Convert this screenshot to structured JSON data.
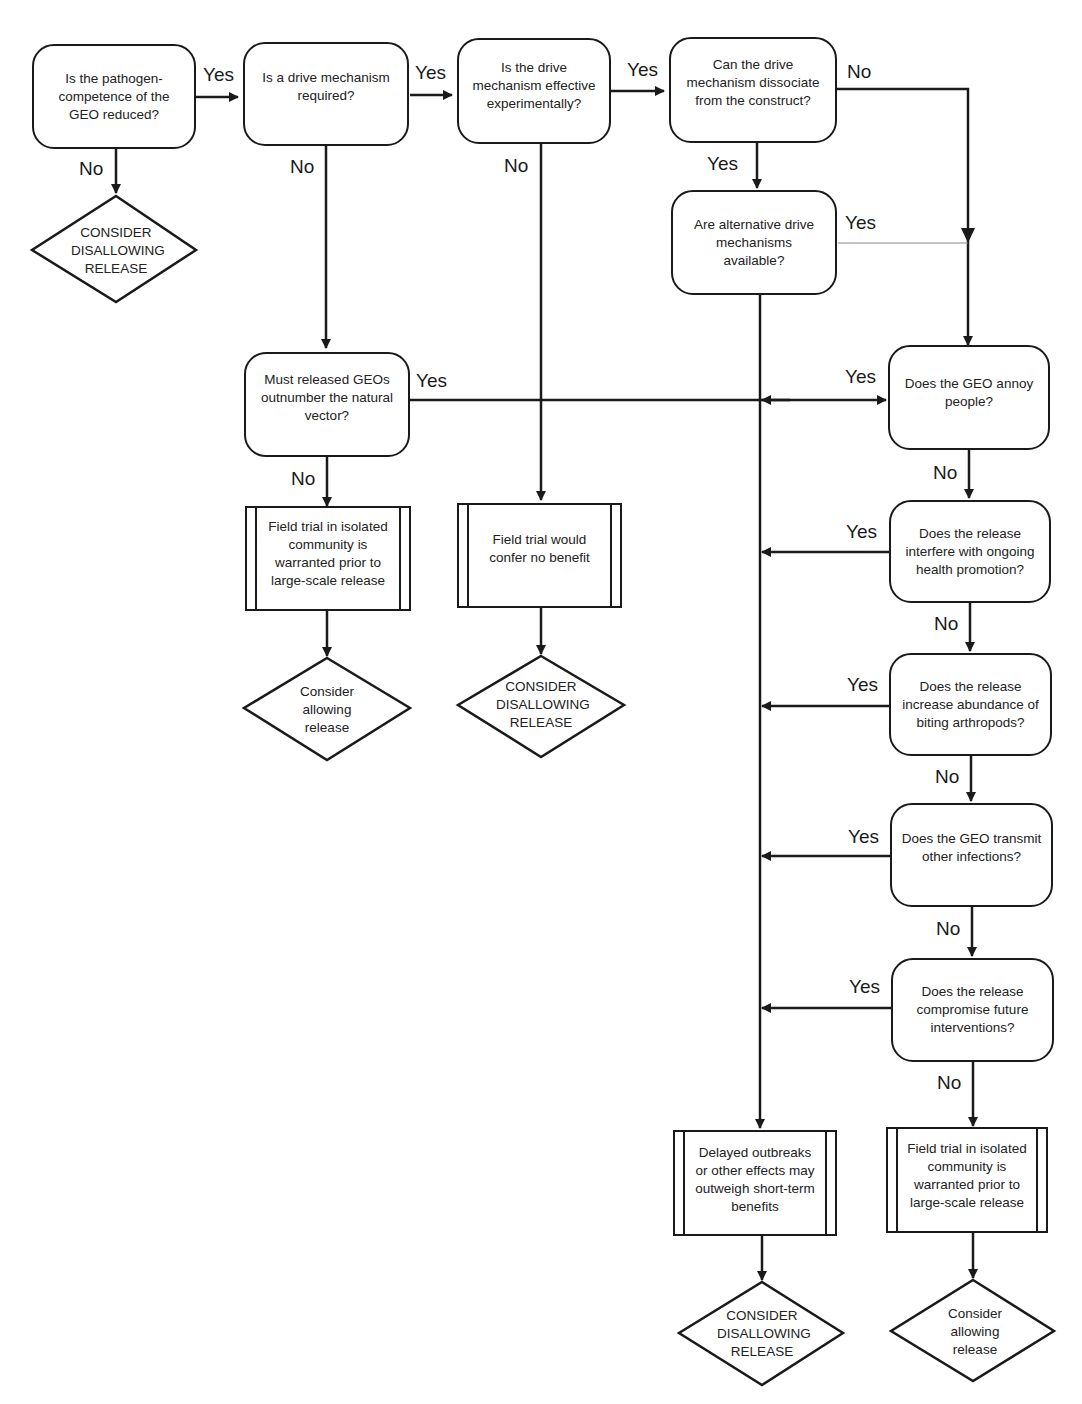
{
  "nodes": {
    "q_pathogen": "Is the pathogen-competence of the GEO reduced?",
    "q_drive_required": "Is a drive mechanism required?",
    "q_drive_effective": "Is the drive mechanism effective experimentally?",
    "q_drive_dissociate": "Can the drive mechanism dissociate from the construct?",
    "q_alternative": "Are alternative drive mechanisms available?",
    "q_outnumber": "Must released GEOs outnumber the natural vector?",
    "q_annoy": "Does the GEO annoy people?",
    "q_interfere": "Does the release interfere with ongoing health promotion?",
    "q_abundance": "Does the release increase abundance of biting arthropods?",
    "q_transmit": "Does the GEO transmit other infections?",
    "q_compromise": "Does the release compromise future interventions?",
    "p_field_trial_left": "Field trial in isolated community is warranted prior to large-scale release",
    "p_no_benefit": "Field trial would confer no benefit",
    "p_delayed": "Delayed outbreaks or other effects may outweigh short-term benefits",
    "p_field_trial_right": "Field trial in isolated community is warranted prior to large-scale release",
    "t_disallow_1": "CONSIDER DISALLOWING RELEASE",
    "t_allow_1": "Consider allowing release",
    "t_disallow_2": "CONSIDER DISALLOWING RELEASE",
    "t_disallow_3": "CONSIDER DISALLOWING RELEASE",
    "t_allow_2": "Consider allowing release"
  },
  "labels": {
    "yes": "Yes",
    "no": "No"
  },
  "style": {
    "stroke": "#1a1a1a",
    "background": "#ffffff"
  }
}
